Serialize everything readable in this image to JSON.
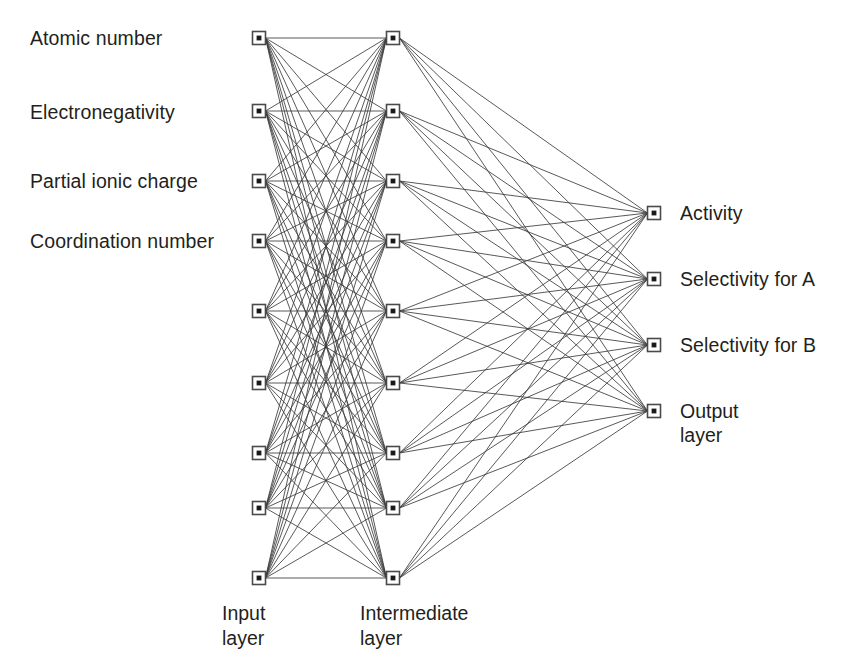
{
  "figure": {
    "type": "neural-network-diagram",
    "title": "",
    "background_color": "#ffffff",
    "node_border_color": "#4a4a4a",
    "node_fill_color": "#ffffff",
    "edge_color": "#3b3b3b",
    "text_color": "#231f20"
  },
  "input_layer": {
    "caption_line1": "Input",
    "caption_line2": "layer",
    "node_count": 9,
    "labels": [
      "Atomic number",
      "Electronegativity",
      "Partial ionic charge",
      "Coordination number"
    ]
  },
  "intermediate_layer": {
    "caption_line1": "Intermediate",
    "caption_line2": "layer",
    "node_count": 9
  },
  "output_layer": {
    "caption_line1": "Output",
    "caption_line2": "layer",
    "node_count": 4,
    "labels": [
      "Activity",
      "Selectivity for A",
      "Selectivity for B",
      "Output"
    ]
  },
  "connections": {
    "input_to_intermediate": "fully-connected",
    "intermediate_to_output": "fully-connected"
  },
  "geometry": {
    "input_x": 259,
    "intermediate_x": 393,
    "output_x": 654,
    "input_node_ys": [
      38,
      111,
      181,
      241,
      311,
      383,
      453,
      508,
      578
    ],
    "intermediate_node_ys": [
      38,
      111,
      181,
      241,
      311,
      383,
      453,
      508,
      578
    ],
    "output_node_ys": [
      213,
      279,
      345,
      411
    ],
    "node_size": 13
  }
}
